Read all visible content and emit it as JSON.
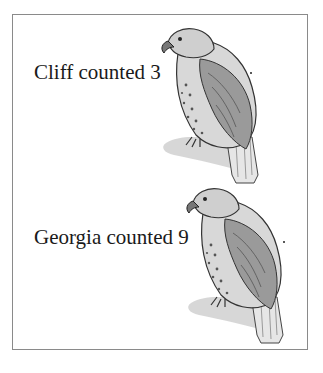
{
  "rows": [
    {
      "name": "Cliff",
      "text": "Cliff counted 3",
      "count": 3,
      "trailing": "."
    },
    {
      "name": "Georgia",
      "text": "Georgia counted 9",
      "count": 9,
      "trailing": "."
    }
  ],
  "image": {
    "subject": "hawk-illustration"
  },
  "colors": {
    "border": "#8a8a8a",
    "text": "#1a1a1a"
  }
}
